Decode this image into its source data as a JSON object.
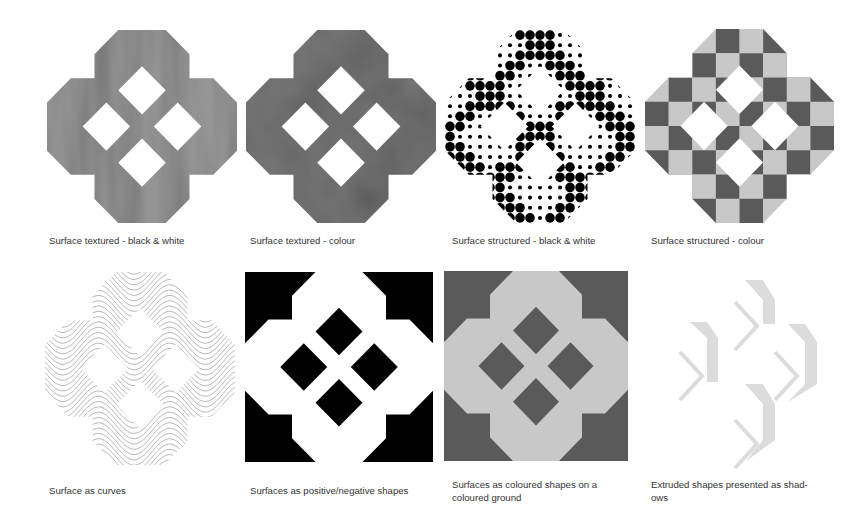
{
  "figure": {
    "panels": [
      {
        "id": "textured-bw",
        "style": "textured-bw",
        "caption": "Surface textured - black & white"
      },
      {
        "id": "textured-colour",
        "style": "textured-colour",
        "caption": "Surface textured - colour"
      },
      {
        "id": "structured-bw",
        "style": "dots",
        "caption": "Surface structured - black & white"
      },
      {
        "id": "structured-colour",
        "style": "checker",
        "caption": "Surface structured - colour"
      },
      {
        "id": "curves",
        "style": "curves",
        "caption": "Surface as curves"
      },
      {
        "id": "pos-neg",
        "style": "posneg",
        "caption": "Surfaces as positive/negative shapes"
      },
      {
        "id": "coloured-ground",
        "style": "ground",
        "caption_line1": "Surfaces as coloured shapes on a",
        "caption_line2": "coloured ground"
      },
      {
        "id": "extruded-shadows",
        "style": "shadows",
        "caption_line1": "Extruded shapes presented as shad-",
        "caption_line2": "ows"
      }
    ],
    "colors": {
      "text": "#333333",
      "bw_texture": "#9a9a9a",
      "colour_texture": "#7a7a7a",
      "dark_tile": "#5a5a5a",
      "light_tile": "#c8c8c8",
      "ink": "#000000",
      "curve_line": "#9c9c9c",
      "shadow": "#dcdcdc"
    }
  }
}
